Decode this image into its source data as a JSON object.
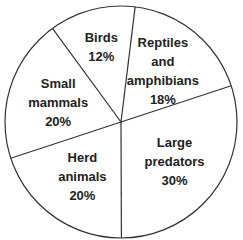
{
  "chart_data": {
    "type": "pie",
    "title": "",
    "slices": [
      {
        "label": "Reptiles and amphibians",
        "lines": [
          "Reptiles",
          "and",
          "amphibians",
          "18%"
        ],
        "value": 18
      },
      {
        "label": "Large predators",
        "lines": [
          "Large",
          "predators",
          "30%"
        ],
        "value": 30
      },
      {
        "label": "Herd animals",
        "lines": [
          "Herd",
          "animals",
          "20%"
        ],
        "value": 20
      },
      {
        "label": "Small mammals",
        "lines": [
          "Small",
          "mammals",
          "20%"
        ],
        "value": 20
      },
      {
        "label": "Birds",
        "lines": [
          "Birds",
          "12%"
        ],
        "value": 12
      }
    ],
    "start_angle_deg": 7,
    "colors": {
      "fill": "#ffffff",
      "stroke": "#333333",
      "text": "#222222"
    }
  }
}
